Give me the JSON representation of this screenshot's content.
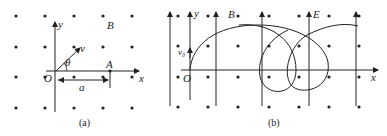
{
  "panel_a": {
    "caption": "(a)",
    "labels": {
      "y_axis": "y",
      "x_axis": "x",
      "origin": "O",
      "velocity": "v",
      "angle": "θ",
      "point": "A",
      "distance": "a",
      "field": "B"
    },
    "field_dots": {
      "xs": [
        16,
        45,
        74,
        103,
        132
      ],
      "ys": [
        16,
        47,
        77,
        108
      ]
    }
  },
  "panel_b": {
    "caption": "(b)",
    "labels": {
      "y_axis": "y",
      "x_axis": "x",
      "origin": "O",
      "velocity": "v₀",
      "magnetic_field": "B",
      "electric_field": "E"
    },
    "field_dots": {
      "xs": [
        178,
        208,
        238,
        269,
        299,
        329,
        359
      ],
      "ys": [
        16,
        46,
        77,
        107
      ]
    },
    "e_field_lines_x": [
      170,
      190,
      216,
      262,
      309,
      356
    ]
  },
  "colors": {
    "ink": "#222222",
    "background": "#ffffff"
  }
}
